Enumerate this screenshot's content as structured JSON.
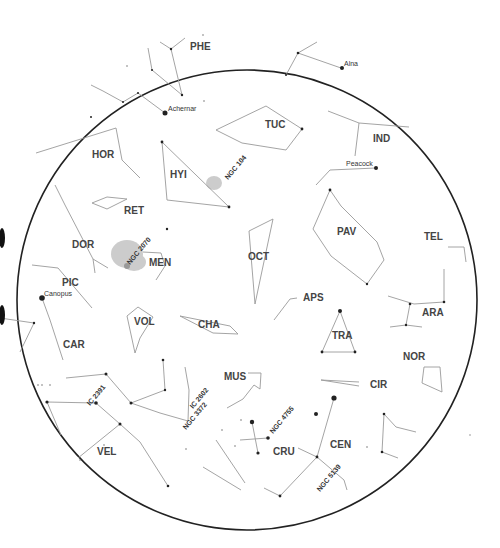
{
  "chart": {
    "colors": {
      "background": "#ffffff",
      "horizon": "#222222",
      "lines": "#9a9a9a",
      "stars": "#222222",
      "labels": "#444444",
      "clouds": "#cccccc"
    }
  },
  "constellations": [
    {
      "abbr": "PHE",
      "x": 190,
      "y": 50
    },
    {
      "abbr": "HOR",
      "x": 92,
      "y": 158
    },
    {
      "abbr": "HYI",
      "x": 170,
      "y": 178
    },
    {
      "abbr": "TUC",
      "x": 265,
      "y": 128
    },
    {
      "abbr": "IND",
      "x": 373,
      "y": 142
    },
    {
      "abbr": "RET",
      "x": 124,
      "y": 214
    },
    {
      "abbr": "DOR",
      "x": 72,
      "y": 248
    },
    {
      "abbr": "MEN",
      "x": 149,
      "y": 266
    },
    {
      "abbr": "PAV",
      "x": 337,
      "y": 235
    },
    {
      "abbr": "TEL",
      "x": 424,
      "y": 240
    },
    {
      "abbr": "OCT",
      "x": 248,
      "y": 260
    },
    {
      "abbr": "PIC",
      "x": 62,
      "y": 286
    },
    {
      "abbr": "APS",
      "x": 303,
      "y": 301
    },
    {
      "abbr": "ARA",
      "x": 422,
      "y": 316
    },
    {
      "abbr": "VOL",
      "x": 134,
      "y": 325
    },
    {
      "abbr": "CHA",
      "x": 198,
      "y": 328
    },
    {
      "abbr": "TRA",
      "x": 332,
      "y": 339
    },
    {
      "abbr": "CAR",
      "x": 63,
      "y": 348
    },
    {
      "abbr": "NOR",
      "x": 403,
      "y": 360
    },
    {
      "abbr": "MUS",
      "x": 224,
      "y": 380
    },
    {
      "abbr": "CIR",
      "x": 370,
      "y": 388
    },
    {
      "abbr": "CRU",
      "x": 273,
      "y": 455
    },
    {
      "abbr": "CEN",
      "x": 330,
      "y": 448
    },
    {
      "abbr": "VEL",
      "x": 97,
      "y": 455
    }
  ],
  "named_stars": [
    {
      "name": "Achernar",
      "x": 165,
      "y": 113
    },
    {
      "name": "Alnair",
      "label": "Alna",
      "x": 342,
      "y": 68
    },
    {
      "name": "Peacock",
      "label": "Peacock",
      "x": 376,
      "y": 168
    },
    {
      "name": "Canopus",
      "label": "Canopus",
      "x": 42,
      "y": 298
    }
  ],
  "deep_sky_objects": [
    {
      "name": "NGC 104",
      "x": 226,
      "y": 180
    },
    {
      "name": "NGC 2070",
      "x": 128,
      "y": 266
    },
    {
      "name": "IC 2391",
      "x": 88,
      "y": 405
    },
    {
      "name": "IC 2602",
      "x": 191,
      "y": 409
    },
    {
      "name": "NGC 3372",
      "x": 184,
      "y": 428
    },
    {
      "name": "NGC 4755",
      "x": 272,
      "y": 433
    },
    {
      "name": "NGC 5139",
      "x": 318,
      "y": 491
    }
  ]
}
